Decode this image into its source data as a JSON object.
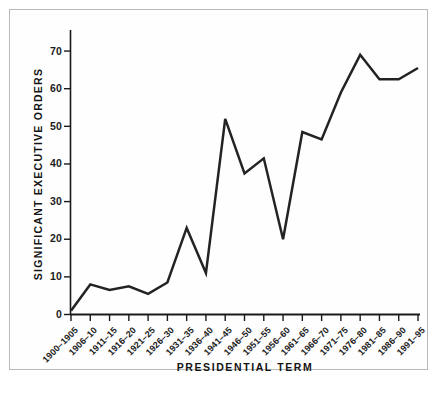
{
  "chart_data": {
    "type": "line",
    "title": "",
    "xlabel": "PRESIDENTIAL TERM",
    "ylabel": "SIGNIFICANT EXECUTIVE ORDERS",
    "categories": [
      "1900–1905",
      "1906–10",
      "1911–15",
      "1916–20",
      "1921–25",
      "1926–30",
      "1931–35",
      "1936–40",
      "1941–45",
      "1946–50",
      "1951–55",
      "1956–60",
      "1961–65",
      "1966–70",
      "1971–75",
      "1976–80",
      "1981–85",
      "1986–90",
      "1991–95"
    ],
    "values": [
      1,
      8,
      6.5,
      7.5,
      5.5,
      8.5,
      23,
      11,
      52,
      37.5,
      41.5,
      20,
      48.5,
      46.5,
      59,
      69,
      62.5,
      62.5,
      65.5
    ],
    "ylim": [
      0,
      74
    ],
    "yticks": [
      0,
      10,
      20,
      30,
      40,
      50,
      60,
      70
    ],
    "ytick_labels": [
      "0",
      "10",
      "20",
      "30",
      "40",
      "50",
      "60",
      "70"
    ],
    "grid": false,
    "legend": "none",
    "line_color": "#232323",
    "axis_color": "#1a1a1a",
    "background_color": "#ffffff",
    "frame_color": "#b9b9b9"
  }
}
